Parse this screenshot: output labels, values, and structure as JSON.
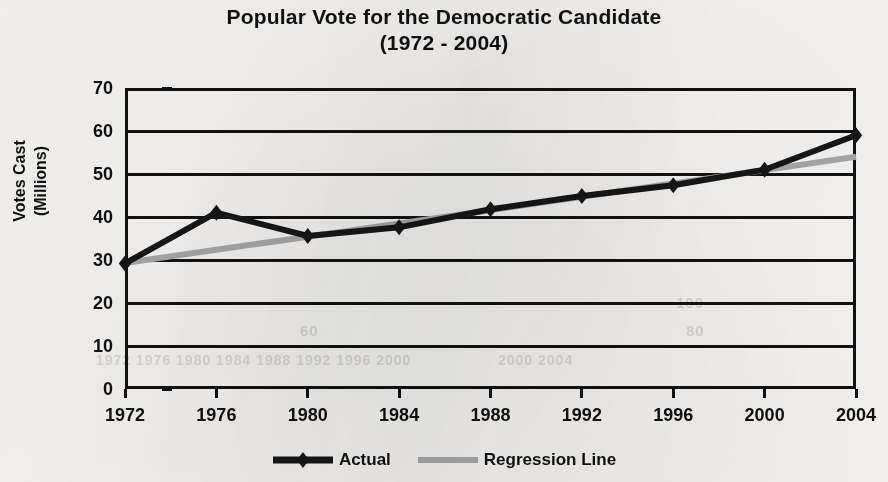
{
  "chart_data": {
    "type": "line",
    "title": "Popular Vote for the Democratic Candidate (1972 - 2004)",
    "title_line1": "Popular Vote for the Democratic Candidate",
    "title_line2": "(1972 - 2004)",
    "xlabel": "",
    "ylabel": "Votes Cast (Millions)",
    "ylabel_line1": "Votes Cast",
    "ylabel_line2": "(Millions)",
    "categories": [
      1972,
      1976,
      1980,
      1984,
      1988,
      1992,
      1996,
      2000,
      2004
    ],
    "x_tick_labels": [
      "1972",
      "1976",
      "1980",
      "1984",
      "1988",
      "1992",
      "1996",
      "2000",
      "2004"
    ],
    "y_tick_labels": [
      "70",
      "60",
      "50",
      "40",
      "30",
      "20",
      "10",
      "0"
    ],
    "y_ticks": [
      70,
      60,
      50,
      40,
      30,
      20,
      10,
      0
    ],
    "ylim": [
      0,
      70
    ],
    "xlim": [
      1972,
      2004
    ],
    "grid": "horizontal",
    "legend_position": "bottom",
    "series": [
      {
        "name": "Actual",
        "color": "#161616",
        "marker": "diamond",
        "values": [
          29.2,
          41.0,
          35.6,
          37.6,
          41.8,
          44.9,
          47.4,
          51.0,
          59.0
        ]
      },
      {
        "name": "Regression Line",
        "color": "#a8a8a8",
        "marker": "none",
        "values": [
          29.3,
          32.4,
          35.4,
          38.5,
          41.6,
          44.7,
          47.8,
          50.9,
          54.0
        ]
      }
    ]
  },
  "legend": {
    "entries": [
      {
        "label": "Actual",
        "swatch": "line-with-diamond-marker",
        "color": "#161616"
      },
      {
        "label": "Regression Line",
        "swatch": "line",
        "color": "#a8a8a8"
      }
    ]
  },
  "ghost_text": {
    "a": "100",
    "b": "80",
    "c": "60",
    "d": "1972  1976  1980  1984  1988  1992  1996  2000",
    "e": "2000  2004"
  }
}
